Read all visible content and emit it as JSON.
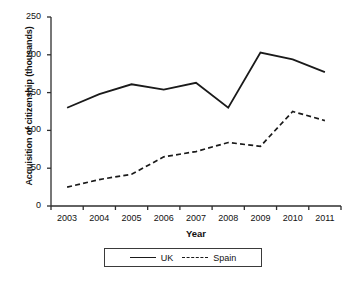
{
  "chart_data": {
    "type": "line",
    "title": "",
    "xlabel": "Year",
    "ylabel": "Acquisition of citizenship (thousands)",
    "categories": [
      "2003",
      "2004",
      "2005",
      "2006",
      "2007",
      "2008",
      "2009",
      "2010",
      "2011"
    ],
    "x": [
      2003,
      2004,
      2005,
      2006,
      2007,
      2008,
      2009,
      2010,
      2011
    ],
    "series": [
      {
        "name": "UK",
        "style": "solid",
        "color": "#1a1a1a",
        "values": [
          130,
          148,
          161,
          154,
          163,
          130,
          203,
          194,
          177
        ]
      },
      {
        "name": "Spain",
        "style": "dashed",
        "color": "#1a1a1a",
        "values": [
          25,
          35,
          42,
          65,
          72,
          84,
          79,
          125,
          113
        ]
      }
    ],
    "ylim": [
      0,
      250
    ],
    "yticks": [
      0,
      50,
      100,
      150,
      200,
      250
    ],
    "ytick_labels": [
      "0",
      "50",
      "100",
      "150",
      "200",
      "250"
    ],
    "xtick_labels": [
      "2003",
      "2004",
      "2005",
      "2006",
      "2007",
      "2008",
      "2009",
      "2010",
      "2011"
    ],
    "grid": false,
    "legend_position": "bottom-center",
    "legend_entries": [
      "UK",
      "Spain"
    ]
  }
}
